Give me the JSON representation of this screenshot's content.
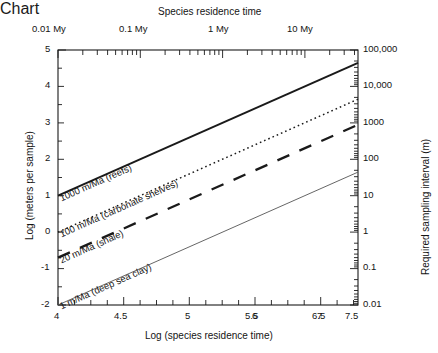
{
  "figure": {
    "background_color": "#ffffff",
    "line_color": "#1a1a1a"
  },
  "chart_data": {
    "type": "line",
    "title": "",
    "xlabel": "Log (species residence time)",
    "ylabel": "Log (meters per sample)",
    "xlim": [
      4,
      7.65
    ],
    "ylim": [
      -2,
      5
    ],
    "grid": false,
    "legend": "inline-labels",
    "top_axis": {
      "label": "Species residence time",
      "scale": "log",
      "tick_labels": [
        "0.01 My",
        "0.1 My",
        "1 My",
        "10 My"
      ],
      "tick_positions": [
        4,
        5,
        6,
        7
      ]
    },
    "right_axis": {
      "label": "Required sampling interval (m)",
      "scale": "log",
      "tick_labels": [
        "100,000",
        "10,000",
        "1000",
        "100",
        "10",
        "1",
        "0.1",
        "0.01"
      ],
      "tick_positions": [
        5,
        4,
        3,
        2,
        1,
        0,
        -1,
        -2
      ]
    },
    "x_ticks": [
      4,
      4.5,
      5,
      5.5,
      6,
      6.5,
      7,
      7.5
    ],
    "x_tick_labels": [
      "4",
      "4.5",
      "5",
      "5.5",
      "6",
      "6.5",
      "7",
      "7.5"
    ],
    "y_ticks": [
      5,
      4,
      3,
      2,
      1,
      0,
      -1,
      -2
    ],
    "y_tick_labels": [
      "5",
      "4",
      "3",
      "2",
      "1",
      "0",
      "-1",
      "-2"
    ],
    "series": [
      {
        "name": "1000 m/Ma (reefs)",
        "label": "1000 m/Ma (reefs)",
        "style": "solid",
        "width": 2.0,
        "color": "#1a1a1a",
        "slope": 1,
        "intercept_at_x4": 1.0,
        "x": [
          4,
          7.65
        ],
        "values": [
          1.0,
          4.65
        ]
      },
      {
        "name": "100 m/Ma (carbonate shelves)",
        "label": "100 m/Ma (carbonate shelves)",
        "style": "dotted",
        "width": 1.4,
        "color": "#1a1a1a",
        "slope": 1,
        "intercept_at_x4": 0.0,
        "x": [
          4,
          7.65
        ],
        "values": [
          0.0,
          3.65
        ]
      },
      {
        "name": "20 m/Ma (shale)",
        "label": "20 m/Ma (shale)",
        "style": "dashed",
        "width": 2.2,
        "color": "#1a1a1a",
        "slope": 1,
        "intercept_at_x4": -0.7,
        "x": [
          4,
          7.65
        ],
        "values": [
          -0.7,
          2.95
        ]
      },
      {
        "name": "1 m/Ma (deep sea clay)",
        "label": "1 m/Ma (deep sea clay)",
        "style": "solid",
        "width": 0.9,
        "color": "#555555",
        "slope": 1,
        "intercept_at_x4": -2.0,
        "x": [
          4,
          7.65
        ],
        "values": [
          -2.0,
          1.65
        ]
      }
    ]
  }
}
